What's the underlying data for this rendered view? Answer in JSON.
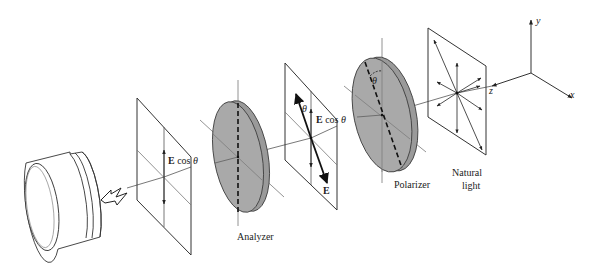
{
  "diagram": {
    "type": "optics-polarization-setup",
    "colors": {
      "line": "#333333",
      "thin_line": "#555555",
      "disc_fill": "#a8a8a8",
      "disc_edge": "#8f8f8f",
      "background": "#ffffff"
    },
    "components": [
      {
        "id": "detector",
        "label": ""
      },
      {
        "id": "analyzer-output-plane",
        "label": ""
      },
      {
        "id": "analyzer",
        "label": "Analyzer"
      },
      {
        "id": "intermediate-plane",
        "label": ""
      },
      {
        "id": "polarizer",
        "label": "Polarizer"
      },
      {
        "id": "natural-light-plane",
        "label": "Natural light"
      }
    ],
    "labels": {
      "analyzer": "Analyzer",
      "polarizer": "Polarizer",
      "natural_line1": "Natural",
      "natural_line2": "light",
      "e_cos_theta_left_E": "E",
      "e_cos_theta_left_rest": " cos ",
      "e_cos_theta_left_theta": "θ",
      "e_cos_theta_mid_E": "E",
      "e_cos_theta_mid_rest": " cos ",
      "e_cos_theta_mid_theta": "θ",
      "e_vector": "E",
      "theta_mid": "θ",
      "theta_polarizer": "θ"
    },
    "axes": {
      "x": "x",
      "y": "y",
      "z": "z"
    }
  }
}
